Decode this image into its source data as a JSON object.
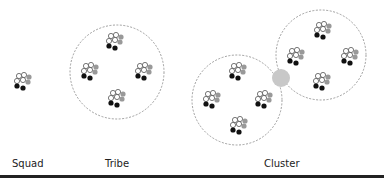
{
  "labels": {
    "squad": "Squad",
    "tribe": "Tribe",
    "cluster": "Cluster"
  },
  "colors": {
    "hollow": "#ffffff",
    "gray": "#999999",
    "black": "#111111",
    "ring": "#888888",
    "overlap": "#c8c8c8"
  }
}
